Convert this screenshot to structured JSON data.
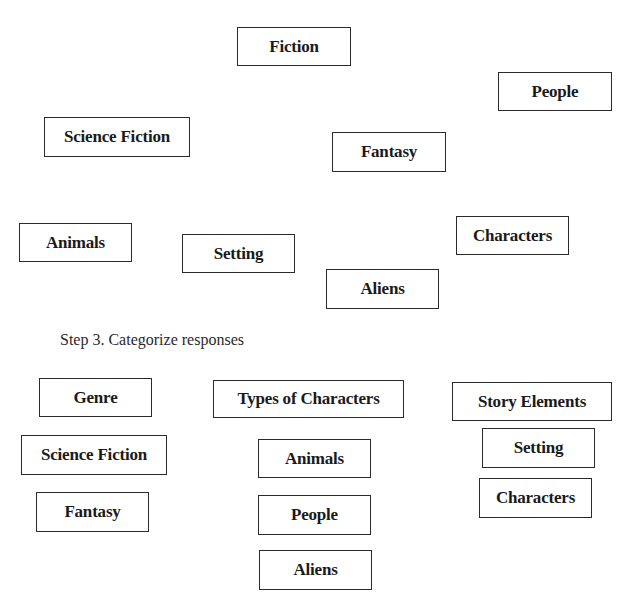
{
  "brainstorm": {
    "responses": [
      {
        "label": "Fiction",
        "x": 237,
        "y": 27,
        "w": 114,
        "h": 39
      },
      {
        "label": "People",
        "x": 498,
        "y": 72,
        "w": 114,
        "h": 39
      },
      {
        "label": "Science Fiction",
        "x": 44,
        "y": 117,
        "w": 146,
        "h": 40
      },
      {
        "label": "Fantasy",
        "x": 332,
        "y": 132,
        "w": 114,
        "h": 40
      },
      {
        "label": "Characters",
        "x": 456,
        "y": 216,
        "w": 113,
        "h": 39
      },
      {
        "label": "Animals",
        "x": 19,
        "y": 223,
        "w": 113,
        "h": 39
      },
      {
        "label": "Setting",
        "x": 182,
        "y": 234,
        "w": 113,
        "h": 39
      },
      {
        "label": "Aliens",
        "x": 326,
        "y": 269,
        "w": 113,
        "h": 40
      }
    ]
  },
  "step3": {
    "caption": "Step 3. Categorize responses",
    "categories": [
      {
        "heading": {
          "label": "Genre",
          "x": 39,
          "y": 378,
          "w": 113,
          "h": 39
        },
        "items": [
          {
            "label": "Science Fiction",
            "x": 21,
            "y": 435,
            "w": 146,
            "h": 40
          },
          {
            "label": "Fantasy",
            "x": 36,
            "y": 492,
            "w": 113,
            "h": 40
          }
        ]
      },
      {
        "heading": {
          "label": "Types of Characters",
          "x": 213,
          "y": 380,
          "w": 191,
          "h": 38
        },
        "items": [
          {
            "label": "Animals",
            "x": 258,
            "y": 439,
            "w": 113,
            "h": 39
          },
          {
            "label": "People",
            "x": 258,
            "y": 495,
            "w": 113,
            "h": 40
          },
          {
            "label": "Aliens",
            "x": 259,
            "y": 550,
            "w": 113,
            "h": 40
          }
        ]
      },
      {
        "heading": {
          "label": "Story Elements",
          "x": 452,
          "y": 382,
          "w": 160,
          "h": 39
        },
        "items": [
          {
            "label": "Setting",
            "x": 482,
            "y": 428,
            "w": 113,
            "h": 40
          },
          {
            "label": "Characters",
            "x": 479,
            "y": 478,
            "w": 113,
            "h": 40
          }
        ]
      }
    ]
  }
}
